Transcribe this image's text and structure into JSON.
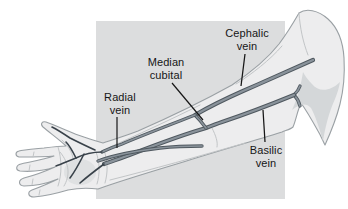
{
  "figure": {
    "type": "anatomical-diagram",
    "labels": {
      "cephalic": {
        "line1": "Cephalic",
        "line2": "vein"
      },
      "median_cubital": {
        "line1": "Median",
        "line2": "cubital"
      },
      "radial": {
        "line1": "Radial",
        "line2": "vein"
      },
      "basilic": {
        "line1": "Basilic",
        "line2": "vein"
      }
    },
    "colors": {
      "background": "#ffffff",
      "panel": "#dcddde",
      "skin": "#ededee",
      "skin_shade": "#d4d7d9",
      "outline": "#9aa0a4",
      "contour": "#c2c5c7",
      "vein_outline": "#4f585f",
      "vein_fill": "#8a939b",
      "hand_vein": "#39424a",
      "leader_line": "#161616",
      "label_text": "#161616"
    }
  }
}
